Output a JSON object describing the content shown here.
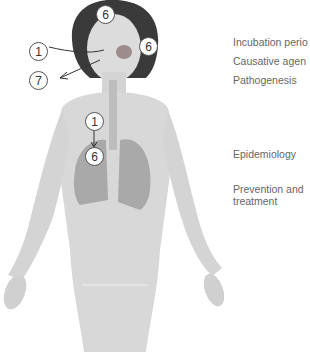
{
  "figure": {
    "markers": [
      {
        "id": "forehead",
        "number": "6"
      },
      {
        "id": "cheek",
        "number": "6"
      },
      {
        "id": "mouth",
        "number": "1"
      },
      {
        "id": "exhale",
        "number": "7"
      },
      {
        "id": "lung-top",
        "number": "1"
      },
      {
        "id": "lung-bottom",
        "number": "6"
      }
    ]
  },
  "labels": {
    "top_cut": "Symptoms",
    "incubation": "Incubation perio",
    "causative": "Causative agen",
    "pathogenesis": "Pathogenesis",
    "epidemiology": "Epidemiology",
    "prevention_line1": "Prevention and",
    "prevention_line2": "treatment"
  },
  "colors": {
    "skin": "#d6d6d6",
    "hair": "#3a3a3a",
    "lung": "#a9a9a9",
    "text": "#666666"
  }
}
